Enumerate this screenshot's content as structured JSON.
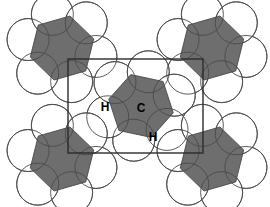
{
  "figure": {
    "background_color": "#ffffff",
    "width": 270,
    "height": 207
  },
  "palette": {
    "carbon_ring_fill": "#6e6e6e",
    "hydrogen_sphere_fill": "#ffffff",
    "outline_color": "#4a4a4a",
    "unit_cell_color": "#2b2b2b",
    "label_color": "#000000"
  },
  "labels": {
    "carbon": {
      "text": "C",
      "x": 141,
      "y": 108
    },
    "hydrogen_left": {
      "text": "H",
      "x": 105,
      "y": 107
    },
    "hydrogen_bottom": {
      "text": "H",
      "x": 153,
      "y": 137
    }
  },
  "unit_cell": {
    "name": "unit-cell-outline",
    "x": 68,
    "y": 59,
    "width": 135,
    "height": 94,
    "stroke_width": 1.4
  },
  "molecules": [
    {
      "id": "molecule-top-left",
      "cx": 62,
      "cy": 48,
      "ring_radius": 33,
      "h_radius": 21,
      "rotation": -16
    },
    {
      "id": "molecule-top-right",
      "cx": 212,
      "cy": 48,
      "ring_radius": 33,
      "h_radius": 21,
      "rotation": -16
    },
    {
      "id": "molecule-center",
      "cx": 141,
      "cy": 106,
      "ring_radius": 33,
      "h_radius": 21,
      "rotation": 12
    },
    {
      "id": "molecule-bottom-left",
      "cx": 62,
      "cy": 159,
      "ring_radius": 33,
      "h_radius": 21,
      "rotation": -16
    },
    {
      "id": "molecule-bottom-right",
      "cx": 212,
      "cy": 159,
      "ring_radius": 33,
      "h_radius": 21,
      "rotation": -16
    }
  ],
  "chart_data": {
    "type": "diagram",
    "annotations": [
      "C",
      "H",
      "H"
    ],
    "molecule_count": 5,
    "hydrogens_per_molecule": 6
  }
}
